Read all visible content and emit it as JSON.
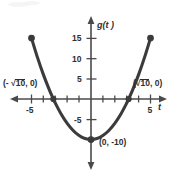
{
  "chart_data": {
    "type": "line",
    "title": "",
    "xlabel": "t",
    "ylabel": "g(t)",
    "function": "g(t) = t^2 - 10",
    "xlim": [
      -5.8,
      6.2
    ],
    "ylim": [
      -14.5,
      18.5
    ],
    "grid": false,
    "legend": null,
    "x_ticks": [
      -5,
      -4,
      -3,
      -2,
      -1,
      1,
      2,
      3,
      4,
      5
    ],
    "x_tick_labels": [
      {
        "value": -5,
        "label": "-5"
      },
      {
        "value": 5,
        "label": "5"
      }
    ],
    "y_ticks": [
      -5,
      5,
      10,
      15
    ],
    "y_tick_labels": [
      {
        "value": 15,
        "label": "15"
      },
      {
        "value": 10,
        "label": "10"
      },
      {
        "value": 5,
        "label": "5"
      },
      {
        "value": -5,
        "label": "-5"
      }
    ],
    "series": [
      {
        "name": "g(t) = t^2 - 10",
        "x": [
          -5,
          -4.5,
          -4,
          -3.5,
          -3.162,
          -3,
          -2.5,
          -2,
          -1.5,
          -1,
          -0.5,
          0,
          0.5,
          1,
          1.5,
          2,
          2.5,
          3,
          3.162,
          3.5,
          4,
          4.5,
          5
        ],
        "y": [
          15,
          10.25,
          6,
          2.25,
          0,
          -1,
          -3.75,
          -6,
          -7.75,
          -9,
          -9.75,
          -10,
          -9.75,
          -9,
          -7.75,
          -6,
          -3.75,
          -1,
          0,
          2.25,
          6,
          10.25,
          15
        ]
      }
    ],
    "marked_points": [
      {
        "x": -5,
        "y": 15,
        "label": "",
        "style": "endpoint-dot"
      },
      {
        "x": 5,
        "y": 15,
        "label": "",
        "style": "endpoint-dot"
      },
      {
        "x": -3.162,
        "y": 0,
        "label": "(- √10, 0)",
        "style": "root-dot"
      },
      {
        "x": 3.162,
        "y": 0,
        "label": "(√10, 0)",
        "style": "root-dot"
      },
      {
        "x": 0,
        "y": -10,
        "label": "(0, -10)",
        "style": "vertex-dot"
      }
    ]
  },
  "labels": {
    "y_axis_name": "g(t )",
    "x_axis_name": "t",
    "tick_15": "15",
    "tick_10": "10",
    "tick_5": "5",
    "tick_neg5": "-5",
    "tick_x_neg5": "-5",
    "tick_x_5": "5",
    "root_left_open": "(- ",
    "root_left_radicand": "10",
    "root_left_close": ", 0)",
    "root_right_open": "(",
    "root_right_radicand": "10",
    "root_right_close": ", 0)",
    "vertex": "(0, -10)",
    "radical_sign": "√"
  },
  "colors": {
    "curve": "#3b3b3b",
    "axis": "#4a4a4a",
    "text": "#2e2e2e",
    "background": "#ffffff"
  }
}
